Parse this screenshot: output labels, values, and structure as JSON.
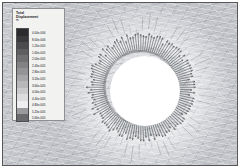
{
  "legend": {
    "title": "Total",
    "subtitle": "Displacement",
    "unit": "m",
    "swatch_colors": [
      "#2b2b2d",
      "#3a3a3c",
      "#4c4c4e",
      "#5e5e60",
      "#707072",
      "#828284",
      "#949496",
      "#a6a6a8",
      "#b8b8ba",
      "#cacacc",
      "#dcdcde",
      "#eeeef0",
      "#9a9a9c",
      "#6a6a6c"
    ],
    "tick_labels": [
      "4.00e-006",
      "8.00e-006",
      "1.20e-005",
      "1.60e-005",
      "2.00e-005",
      "2.40e-005",
      "2.80e-005",
      "3.20e-005",
      "3.60e-005",
      "4.00e-005",
      "4.40e-005",
      "4.80e-005",
      "5.20e-005",
      "5.60e-005"
    ]
  },
  "plot": {
    "frame_color": "#58585a",
    "background_color": "#c8cace",
    "hole_color": "#ffffff",
    "vector_color": "#2f3134"
  },
  "chart_data": {
    "type": "scatter",
    "title": "Total Displacement",
    "subtitle": "Radial displacement vector field around a circular hole",
    "xlabel": "",
    "ylabel": "",
    "legend_position": "top-left",
    "grid": false,
    "colorbar": {
      "label": "Total Displacement",
      "unit": "m",
      "scale": "linear",
      "ticks": [
        4e-06,
        8e-06,
        1.2e-05,
        1.6e-05,
        2e-05,
        2.4e-05,
        2.8e-05,
        3.2e-05,
        3.6e-05,
        4e-05,
        4.4e-05,
        4.8e-05,
        5.2e-05,
        5.6e-05
      ],
      "vmin": 0.0,
      "vmax": 5.6e-05
    },
    "geometry": {
      "hole_center_x": 142,
      "hole_center_y": 88,
      "hole_radius_px": 35,
      "vector_count": 120,
      "vector_direction": "radial-outward"
    }
  }
}
